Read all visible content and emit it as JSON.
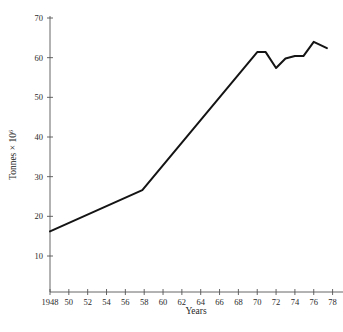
{
  "chart_data": {
    "type": "line",
    "title": "",
    "xlabel": "Years",
    "ylabel": "Tonnes × 10",
    "ylabel_exponent": "6",
    "xlim": [
      1948,
      1979
    ],
    "ylim": [
      0,
      72
    ],
    "grid": false,
    "legend": null,
    "x_tick_labels": [
      "1948",
      "50",
      "52",
      "54",
      "56",
      "58",
      "60",
      "62",
      "64",
      "66",
      "68",
      "70",
      "72",
      "74",
      "76",
      "78"
    ],
    "x_ticks": [
      1948,
      1950,
      1952,
      1954,
      1956,
      1958,
      1960,
      1962,
      1964,
      1966,
      1968,
      1970,
      1972,
      1974,
      1976,
      1978
    ],
    "y_tick_labels": [
      "70",
      "60",
      "50",
      "40",
      "30",
      "20",
      "10"
    ],
    "y_ticks": [
      70,
      60,
      50,
      40,
      30,
      20,
      10
    ],
    "series": [
      {
        "name": "Production",
        "color": "#141414",
        "x": [
          1948,
          1957.8,
          1970.0,
          1970.9,
          1972.0,
          1973.0,
          1974.0,
          1974.9,
          1976.0,
          1977.4
        ],
        "values": [
          16.2,
          26.6,
          61.4,
          61.4,
          57.4,
          59.8,
          60.4,
          60.4,
          64.0,
          62.4
        ]
      }
    ]
  },
  "axes": {
    "y_axis_name": "y-axis",
    "x_axis_name": "x-axis"
  }
}
